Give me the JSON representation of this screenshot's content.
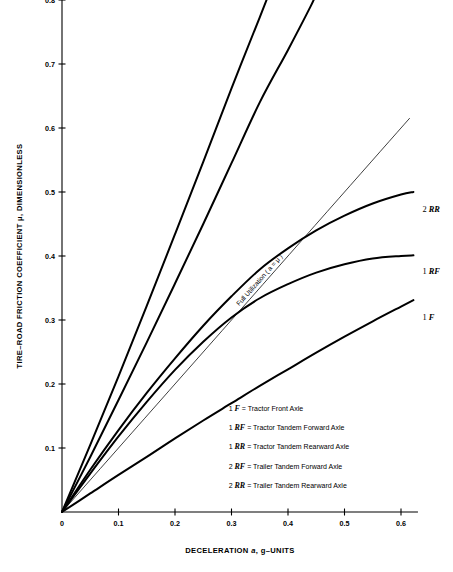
{
  "chart_data": {
    "type": "line",
    "title": "",
    "xlabel": "DECELERATION a, g–UNITS",
    "ylabel": "TIRE–ROAD FRICTION COEFFICIENT μ, DIMENSIONLESS",
    "xlim": [
      0,
      0.63
    ],
    "ylim": [
      0,
      0.8
    ],
    "xticks": [
      0,
      0.1,
      0.2,
      0.3,
      0.4,
      0.5,
      0.6
    ],
    "xtick_labels": [
      "0",
      "0.1",
      "0.2",
      "0.3",
      "0.4",
      "0.5",
      "0.6"
    ],
    "yticks": [
      0.1,
      0.2,
      0.3,
      0.4,
      0.5,
      0.6,
      0.7,
      0.8
    ],
    "ytick_labels": [
      "0.1",
      "0.2",
      "0.3",
      "0.4",
      "0.5",
      "0.6",
      "0.7",
      "0.8"
    ],
    "grid": false,
    "legend_position": "inside-lower-right",
    "series": [
      {
        "name": "2 RF",
        "label_prefix": "2",
        "label_code": "RF",
        "label_x": 0.355,
        "label_y": 0.825,
        "stroke_width": 2.0,
        "points": [
          [
            0.0,
            0.0
          ],
          [
            0.05,
            0.105
          ],
          [
            0.1,
            0.212
          ],
          [
            0.15,
            0.322
          ],
          [
            0.2,
            0.434
          ],
          [
            0.25,
            0.547
          ],
          [
            0.3,
            0.662
          ],
          [
            0.35,
            0.773
          ],
          [
            0.3655,
            0.808
          ]
        ]
      },
      {
        "name": "1 RR",
        "label_prefix": "1",
        "label_code": "RR",
        "label_x": 0.445,
        "label_y": 0.825,
        "stroke_width": 2.0,
        "points": [
          [
            0.0,
            0.0
          ],
          [
            0.05,
            0.086
          ],
          [
            0.1,
            0.175
          ],
          [
            0.15,
            0.265
          ],
          [
            0.2,
            0.357
          ],
          [
            0.25,
            0.45
          ],
          [
            0.3,
            0.545
          ],
          [
            0.35,
            0.64
          ],
          [
            0.4,
            0.722
          ],
          [
            0.44,
            0.79
          ],
          [
            0.4475,
            0.805
          ]
        ]
      },
      {
        "name": "2 RR",
        "label_prefix": "2",
        "label_code": "RR",
        "label_x": 0.638,
        "label_y": 0.468,
        "stroke_width": 2.0,
        "points": [
          [
            0.0,
            0.0
          ],
          [
            0.05,
            0.066
          ],
          [
            0.1,
            0.128
          ],
          [
            0.15,
            0.186
          ],
          [
            0.2,
            0.24
          ],
          [
            0.25,
            0.291
          ],
          [
            0.3,
            0.337
          ],
          [
            0.35,
            0.379
          ],
          [
            0.4,
            0.412
          ],
          [
            0.45,
            0.44
          ],
          [
            0.5,
            0.463
          ],
          [
            0.55,
            0.482
          ],
          [
            0.6,
            0.496
          ],
          [
            0.622,
            0.5
          ]
        ]
      },
      {
        "name": "1 RF",
        "label_prefix": "1",
        "label_code": "RF",
        "label_x": 0.638,
        "label_y": 0.372,
        "stroke_width": 2.0,
        "points": [
          [
            0.0,
            0.0
          ],
          [
            0.05,
            0.06
          ],
          [
            0.1,
            0.118
          ],
          [
            0.15,
            0.172
          ],
          [
            0.2,
            0.222
          ],
          [
            0.25,
            0.266
          ],
          [
            0.3,
            0.304
          ],
          [
            0.35,
            0.334
          ],
          [
            0.4,
            0.356
          ],
          [
            0.45,
            0.374
          ],
          [
            0.5,
            0.387
          ],
          [
            0.55,
            0.396
          ],
          [
            0.6,
            0.4
          ],
          [
            0.622,
            0.401
          ]
        ]
      },
      {
        "name": "1 F",
        "label_prefix": "1",
        "label_code": "F",
        "label_x": 0.638,
        "label_y": 0.3,
        "stroke_width": 2.0,
        "points": [
          [
            0.0,
            0.0
          ],
          [
            0.05,
            0.029
          ],
          [
            0.1,
            0.058
          ],
          [
            0.15,
            0.086
          ],
          [
            0.2,
            0.115
          ],
          [
            0.25,
            0.143
          ],
          [
            0.3,
            0.17
          ],
          [
            0.35,
            0.197
          ],
          [
            0.4,
            0.223
          ],
          [
            0.45,
            0.249
          ],
          [
            0.5,
            0.274
          ],
          [
            0.55,
            0.298
          ],
          [
            0.6,
            0.321
          ],
          [
            0.622,
            0.331
          ]
        ]
      }
    ],
    "reference_line": {
      "name": "Full Utilization",
      "label": "Full Utilization ( a = μ )",
      "equation": "a = μ",
      "stroke_width": 0.75,
      "points": [
        [
          0.0,
          0.0
        ],
        [
          0.615,
          0.615
        ]
      ]
    }
  },
  "legend": {
    "entries": [
      {
        "prefix": "1",
        "code": "F",
        "description": "= Tractor Front Axle"
      },
      {
        "prefix": "1",
        "code": "RF",
        "description": "= Tractor Tandem Forward Axle"
      },
      {
        "prefix": "1",
        "code": "RR",
        "description": "= Tractor Tandem Rearward Axle"
      },
      {
        "prefix": "2",
        "code": "RF",
        "description": "= Trailer Tandem Forward Axle"
      },
      {
        "prefix": "2",
        "code": "RR",
        "description": "= Trailer Tandem Rearward Axle"
      }
    ]
  },
  "axes": {
    "x_title_main": "DECELERATION",
    "x_title_symbol": "a",
    "x_title_units": ", g–UNITS",
    "y_title": "TIRE–ROAD FRICTION COEFFICIENT μ, DIMENSIONLESS"
  },
  "colors": {
    "ink": "#000000",
    "background": "#ffffff",
    "reference": "#333333"
  }
}
